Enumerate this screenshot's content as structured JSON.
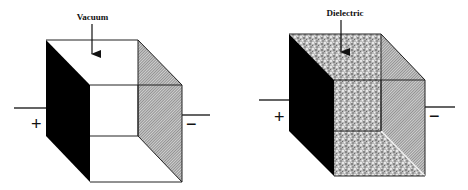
{
  "figure": {
    "colors": {
      "plate_positive": "#000000",
      "plate_negative_hatch": "#8a8a8a",
      "dielectric_fill": "#9a9a9a",
      "background": "#ffffff"
    }
  },
  "capacitors": [
    {
      "id": "vacuum",
      "label": "Vacuum",
      "positive_symbol": "+",
      "negative_symbol": "−",
      "filled": false
    },
    {
      "id": "dielectric",
      "label": "Dielectric",
      "positive_symbol": "+",
      "negative_symbol": "−",
      "filled": true
    }
  ]
}
